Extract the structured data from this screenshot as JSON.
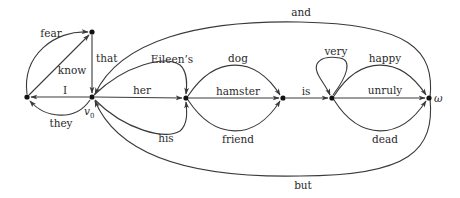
{
  "diagram": {
    "type": "word-lattice graph",
    "nodes": [
      {
        "id": "n_left",
        "x": 27,
        "y": 97,
        "label": ""
      },
      {
        "id": "n_top",
        "x": 92,
        "y": 32,
        "label": ""
      },
      {
        "id": "v0",
        "x": 92,
        "y": 97,
        "label": "v",
        "label_sub": "0"
      },
      {
        "id": "n_mid1",
        "x": 186,
        "y": 98,
        "label": ""
      },
      {
        "id": "n_mid2",
        "x": 283,
        "y": 98,
        "label": ""
      },
      {
        "id": "n_mid3",
        "x": 332,
        "y": 98,
        "label": ""
      },
      {
        "id": "omega",
        "x": 429,
        "y": 98,
        "label": "ω"
      }
    ],
    "edges": [
      {
        "label": "fear",
        "from": "n_left",
        "to": "n_top"
      },
      {
        "label": "know",
        "from": "n_left",
        "to": "n_top"
      },
      {
        "label": "that",
        "from": "n_top",
        "to": "v0"
      },
      {
        "label": "I",
        "from": "v0",
        "to": "n_left"
      },
      {
        "label": "they",
        "from": "v0",
        "to": "n_left"
      },
      {
        "label": "and",
        "from": "omega",
        "to": "v0"
      },
      {
        "label": "Eileen’s",
        "from": "v0",
        "to": "n_mid1"
      },
      {
        "label": "her",
        "from": "v0",
        "to": "n_mid1"
      },
      {
        "label": "his",
        "from": "v0",
        "to": "n_mid1"
      },
      {
        "label": "but",
        "from": "omega",
        "to": "v0"
      },
      {
        "label": "dog",
        "from": "n_mid1",
        "to": "n_mid2"
      },
      {
        "label": "hamster",
        "from": "n_mid1",
        "to": "n_mid2"
      },
      {
        "label": "friend",
        "from": "n_mid1",
        "to": "n_mid2"
      },
      {
        "label": "is",
        "from": "n_mid2",
        "to": "n_mid3"
      },
      {
        "label": "very",
        "from": "n_mid3",
        "to": "n_mid3"
      },
      {
        "label": "happy",
        "from": "n_mid3",
        "to": "omega"
      },
      {
        "label": "unruly",
        "from": "n_mid3",
        "to": "omega"
      },
      {
        "label": "dead",
        "from": "n_mid3",
        "to": "omega"
      }
    ],
    "labels": {
      "fear": "fear",
      "know": "know",
      "that": "that",
      "I": "I",
      "they": "they",
      "and": "and",
      "eileens": "Eileen’s",
      "her": "her",
      "his": "his",
      "but": "but",
      "dog": "dog",
      "hamster": "hamster",
      "friend": "friend",
      "is": "is",
      "very": "very",
      "happy": "happy",
      "unruly": "unruly",
      "dead": "dead",
      "v0_main": "v",
      "v0_sub": "0",
      "omega": "ω"
    },
    "colors": {
      "edge": "#3a3a3a",
      "node": "#111111",
      "text": "#2a2a2a",
      "background": "#ffffff"
    }
  }
}
